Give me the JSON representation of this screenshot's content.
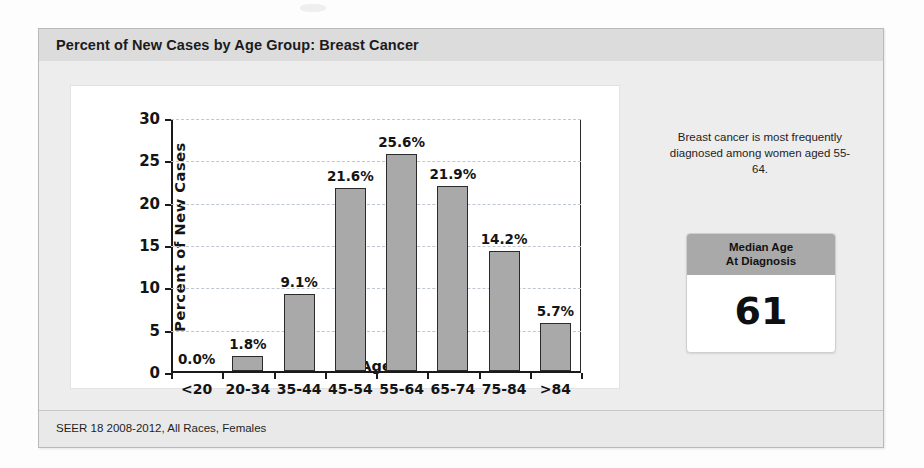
{
  "chart_title": "Percent of New Cases by Age Group: Breast Cancer",
  "footer_note": "SEER 18 2008-2012, All Races, Females",
  "side_panel": {
    "note": "Breast cancer is most frequently diagnosed among women aged 55-64.",
    "median_card": {
      "header_line1": "Median Age",
      "header_line2": "At Diagnosis",
      "value": "61"
    }
  },
  "colors": {
    "bar_fill": "#a9a9a9",
    "bar_border": "#2b2b2b",
    "title_bar": "#dcdcdc",
    "panel_background": "#ededed",
    "plot_background": "#ffffff",
    "gridline": "#bfc6cf",
    "card_header": "#a9a9a9"
  },
  "chart_data": {
    "type": "bar",
    "title": "Percent of New Cases by Age Group: Breast Cancer",
    "subtitle": "",
    "xlabel": "Age",
    "ylabel": "Percent of New Cases",
    "categories": [
      "<20",
      "20-34",
      "35-44",
      "45-54",
      "55-64",
      "65-74",
      "75-84",
      ">84"
    ],
    "values": [
      0.0,
      1.8,
      9.1,
      21.6,
      25.6,
      21.9,
      14.2,
      5.7
    ],
    "data_labels": [
      "0.0%",
      "1.8%",
      "9.1%",
      "21.6%",
      "25.6%",
      "21.9%",
      "14.2%",
      "5.7%"
    ],
    "ylim": [
      0,
      30
    ],
    "yticks": [
      0,
      5,
      10,
      15,
      20,
      25,
      30
    ],
    "ytick_labels": [
      "0",
      "5",
      "10",
      "15",
      "20",
      "25",
      "30"
    ],
    "grid": true,
    "grid_axis": "y",
    "legend": false,
    "legend_position": "none",
    "annotations": [
      "Breast cancer is most frequently diagnosed among women aged 55-64.",
      "Median Age At Diagnosis: 61"
    ]
  }
}
